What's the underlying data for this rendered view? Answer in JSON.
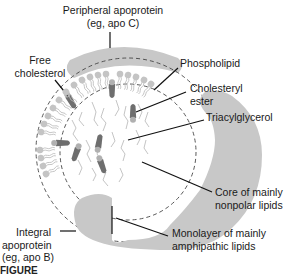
{
  "diagram": {
    "labels": {
      "peripheral_apoprotein": {
        "line1": "Peripheral apoprotein",
        "line2": "(eg, apo C)"
      },
      "free_cholesterol": {
        "line1": "Free",
        "line2": "cholesterol"
      },
      "phospholipid": {
        "line1": "Phospholipid"
      },
      "cholesteryl_ester": {
        "line1": "Cholesteryl",
        "line2": "ester"
      },
      "triacylglycerol": {
        "line1": "Triacylglycerol"
      },
      "core": {
        "line1": "Core of mainly",
        "line2": "nonpolar lipids"
      },
      "integral_apoprotein": {
        "line1": "Integral",
        "line2": "apoprotein",
        "line3": "(eg, apo B)"
      },
      "monolayer": {
        "line1": "Monolayer of mainly",
        "line2": "amphipathic lipids"
      }
    },
    "caption": "FIGURE",
    "colors": {
      "apoprotein_fill": "#c8c8c8",
      "phospholipid_head": "#c4c4c4",
      "cholesterol": "#6e6e6e",
      "cholesterol_tip": "#b0b0b0",
      "leader_line": "#111111",
      "dashed": "#444444"
    }
  }
}
